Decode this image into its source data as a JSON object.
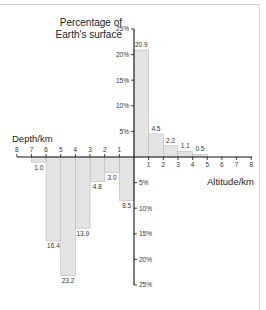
{
  "chart_data": {
    "type": "bar",
    "title": "Percentage of Earth's surface",
    "title_lines": [
      "Percentage of",
      "Earth's surface"
    ],
    "xlabel_left": "Depth/km",
    "xlabel_right": "Altitude/km",
    "ylabel": "Percentage of Earth's surface",
    "y_ticks_up": [
      "25%",
      "20%",
      "15%",
      "10%",
      "5%"
    ],
    "y_ticks_down": [
      "5%",
      "10%",
      "15%",
      "20%",
      "25%"
    ],
    "x_ticks_left": [
      "8",
      "7",
      "6",
      "5",
      "4",
      "3",
      "2",
      "1"
    ],
    "x_ticks_right": [
      "1",
      "2",
      "3",
      "4",
      "5",
      "6",
      "7",
      "8"
    ],
    "ylim": [
      -25,
      25
    ],
    "xlim": [
      -8,
      8
    ],
    "grid": false,
    "legend": null,
    "series": [
      {
        "name": "Altitude (land above sea level)",
        "categories": [
          "0-1 km",
          "1-2 km",
          "2-3 km",
          "3-4 km",
          "4-5 km"
        ],
        "values": [
          20.9,
          4.5,
          2.2,
          1.1,
          0.5
        ],
        "labels": [
          "20.9",
          "4.5",
          "2.2",
          "1.1",
          "0.5"
        ]
      },
      {
        "name": "Depth (ocean below sea level)",
        "categories": [
          "0-1 km",
          "1-2 km",
          "2-3 km",
          "3-4 km",
          "4-5 km",
          "5-6 km",
          "6-7 km"
        ],
        "values": [
          8.5,
          3.0,
          4.8,
          13.9,
          23.2,
          16.4,
          1.0
        ],
        "labels": [
          "8.5",
          "3.0",
          "4.8",
          "13.9",
          "23.2",
          "16.4",
          "1.0"
        ]
      }
    ],
    "colors": {
      "bar_fill": "#e4e4e4",
      "bar_stroke": "#b8b8b8",
      "axis": "#111111"
    }
  }
}
